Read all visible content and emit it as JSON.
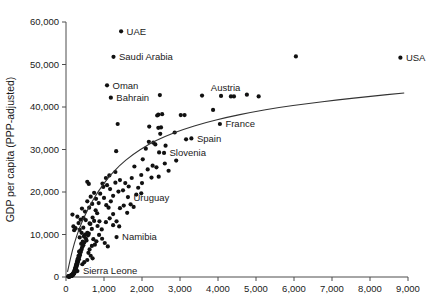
{
  "chart_data": {
    "type": "scatter",
    "title": "",
    "xlabel": "",
    "ylabel": "GDP per capita (PPP-adjusted)",
    "xlim": [
      0,
      9000
    ],
    "ylim": [
      0,
      60000
    ],
    "grid": false,
    "legend": null,
    "xticks": [
      "0",
      "1,000",
      "2,000",
      "3,000",
      "4,000",
      "5,000",
      "6,000",
      "7,000",
      "8,000",
      "9,000"
    ],
    "xtick_values": [
      0,
      1000,
      2000,
      3000,
      4000,
      5000,
      6000,
      7000,
      8000,
      9000
    ],
    "yticks": [
      "0",
      "10,000",
      "20,000",
      "30,000",
      "40,000",
      "50,000",
      "60,000"
    ],
    "ytick_values": [
      0,
      10000,
      20000,
      30000,
      40000,
      50000,
      60000
    ],
    "marker_color": "#111111",
    "trend_color": "#333333",
    "annotations": [
      {
        "label": "UAE",
        "x": 1450,
        "y": 57800,
        "anchor": "right"
      },
      {
        "label": "Saudi Arabia",
        "x": 1250,
        "y": 51800,
        "anchor": "right"
      },
      {
        "label": "Oman",
        "x": 1080,
        "y": 45100,
        "anchor": "right"
      },
      {
        "label": "Bahrain",
        "x": 1180,
        "y": 42200,
        "anchor": "right"
      },
      {
        "label": "Austria",
        "x": 4200,
        "y": 42300,
        "anchor": "above"
      },
      {
        "label": "France",
        "x": 4050,
        "y": 36000,
        "anchor": "right"
      },
      {
        "label": "Spain",
        "x": 3300,
        "y": 32600,
        "anchor": "right"
      },
      {
        "label": "Slovenia",
        "x": 2580,
        "y": 29200,
        "anchor": "right"
      },
      {
        "label": "Uruguay",
        "x": 1630,
        "y": 18800,
        "anchor": "right"
      },
      {
        "label": "Namibia",
        "x": 1330,
        "y": 9400,
        "anchor": "right"
      },
      {
        "label": "Sierra Leone",
        "x": 300,
        "y": 1400,
        "anchor": "right"
      },
      {
        "label": "USA",
        "x": 8800,
        "y": 51600,
        "anchor": "right"
      }
    ],
    "points": [
      [
        8800,
        51600
      ],
      [
        6050,
        51900
      ],
      [
        1450,
        57800
      ],
      [
        1250,
        51800
      ],
      [
        1080,
        45100
      ],
      [
        1180,
        42200
      ],
      [
        2470,
        42800
      ],
      [
        3580,
        42700
      ],
      [
        4080,
        42600
      ],
      [
        4340,
        42500
      ],
      [
        4420,
        42500
      ],
      [
        4760,
        42900
      ],
      [
        5070,
        42500
      ],
      [
        2430,
        38200
      ],
      [
        2530,
        38300
      ],
      [
        2400,
        38000
      ],
      [
        2190,
        35400
      ],
      [
        2430,
        35100
      ],
      [
        2500,
        35200
      ],
      [
        3870,
        39300
      ],
      [
        4050,
        36000
      ],
      [
        1360,
        36000
      ],
      [
        1320,
        29600
      ],
      [
        3020,
        38100
      ],
      [
        3120,
        38100
      ],
      [
        2860,
        34000
      ],
      [
        2480,
        33700
      ],
      [
        3300,
        32600
      ],
      [
        3160,
        32400
      ],
      [
        2580,
        29200
      ],
      [
        2450,
        29300
      ],
      [
        2620,
        30900
      ],
      [
        2300,
        31600
      ],
      [
        2350,
        31200
      ],
      [
        2180,
        31800
      ],
      [
        2100,
        30200
      ],
      [
        2020,
        27700
      ],
      [
        2280,
        26200
      ],
      [
        2380,
        25800
      ],
      [
        2440,
        23600
      ],
      [
        2150,
        25300
      ],
      [
        1980,
        24000
      ],
      [
        1800,
        26000
      ],
      [
        1730,
        23300
      ],
      [
        1650,
        21300
      ],
      [
        1560,
        22100
      ],
      [
        1500,
        20400
      ],
      [
        1420,
        22800
      ],
      [
        1380,
        20100
      ],
      [
        1300,
        22200
      ],
      [
        1240,
        19100
      ],
      [
        1180,
        17800
      ],
      [
        1120,
        16300
      ],
      [
        1060,
        16900
      ],
      [
        1000,
        18600
      ],
      [
        960,
        22000
      ],
      [
        900,
        19600
      ],
      [
        860,
        17400
      ],
      [
        820,
        15000
      ],
      [
        780,
        15700
      ],
      [
        740,
        13200
      ],
      [
        700,
        14000
      ],
      [
        680,
        11300
      ],
      [
        640,
        12500
      ],
      [
        600,
        10200
      ],
      [
        580,
        9800
      ],
      [
        560,
        10400
      ],
      [
        540,
        8600
      ],
      [
        520,
        9100
      ],
      [
        500,
        10000
      ],
      [
        480,
        8100
      ],
      [
        470,
        9600
      ],
      [
        455,
        7500
      ],
      [
        440,
        8300
      ],
      [
        425,
        7000
      ],
      [
        410,
        6500
      ],
      [
        400,
        7800
      ],
      [
        390,
        5900
      ],
      [
        380,
        6200
      ],
      [
        370,
        5200
      ],
      [
        360,
        5700
      ],
      [
        350,
        4700
      ],
      [
        345,
        6000
      ],
      [
        340,
        4200
      ],
      [
        330,
        5000
      ],
      [
        320,
        3800
      ],
      [
        315,
        4400
      ],
      [
        310,
        3400
      ],
      [
        300,
        4000
      ],
      [
        295,
        3000
      ],
      [
        290,
        3600
      ],
      [
        285,
        2700
      ],
      [
        280,
        3200
      ],
      [
        275,
        2400
      ],
      [
        270,
        2900
      ],
      [
        265,
        2100
      ],
      [
        260,
        2600
      ],
      [
        255,
        1800
      ],
      [
        250,
        2300
      ],
      [
        245,
        1500
      ],
      [
        240,
        2000
      ],
      [
        235,
        1300
      ],
      [
        230,
        1700
      ],
      [
        225,
        1100
      ],
      [
        220,
        1400
      ],
      [
        215,
        900
      ],
      [
        210,
        1200
      ],
      [
        205,
        750
      ],
      [
        200,
        1000
      ],
      [
        195,
        620
      ],
      [
        190,
        850
      ],
      [
        185,
        520
      ],
      [
        180,
        700
      ],
      [
        175,
        440
      ],
      [
        170,
        600
      ],
      [
        165,
        380
      ],
      [
        160,
        520
      ],
      [
        155,
        320
      ],
      [
        150,
        450
      ],
      [
        145,
        280
      ],
      [
        140,
        400
      ],
      [
        135,
        240
      ],
      [
        130,
        350
      ],
      [
        125,
        210
      ],
      [
        120,
        310
      ],
      [
        115,
        180
      ],
      [
        110,
        270
      ],
      [
        105,
        160
      ],
      [
        100,
        230
      ],
      [
        95,
        140
      ],
      [
        90,
        200
      ],
      [
        85,
        120
      ],
      [
        80,
        180
      ],
      [
        75,
        105
      ],
      [
        70,
        160
      ],
      [
        65,
        95
      ],
      [
        60,
        140
      ],
      [
        170,
        14700
      ],
      [
        195,
        11900
      ],
      [
        215,
        11000
      ],
      [
        250,
        11500
      ],
      [
        300,
        14200
      ],
      [
        330,
        12700
      ],
      [
        360,
        11100
      ],
      [
        385,
        13500
      ],
      [
        420,
        16100
      ],
      [
        460,
        13900
      ],
      [
        500,
        15400
      ],
      [
        560,
        17800
      ],
      [
        610,
        16300
      ],
      [
        650,
        18900
      ],
      [
        690,
        17200
      ],
      [
        740,
        19800
      ],
      [
        790,
        18400
      ],
      [
        560,
        22400
      ],
      [
        600,
        21900
      ],
      [
        980,
        21200
      ],
      [
        1080,
        21600
      ],
      [
        1160,
        20700
      ],
      [
        1240,
        14800
      ],
      [
        1330,
        9400
      ],
      [
        1630,
        18800
      ],
      [
        1420,
        16200
      ],
      [
        1520,
        16800
      ],
      [
        1610,
        15100
      ],
      [
        1700,
        17100
      ],
      [
        1780,
        16500
      ],
      [
        1240,
        12200
      ],
      [
        1150,
        13800
      ],
      [
        1050,
        12900
      ],
      [
        940,
        11200
      ],
      [
        870,
        9900
      ],
      [
        800,
        8400
      ],
      [
        760,
        7600
      ],
      [
        720,
        8900
      ],
      [
        680,
        7300
      ],
      [
        1400,
        11900
      ],
      [
        1330,
        13100
      ],
      [
        1850,
        19400
      ],
      [
        1900,
        21000
      ],
      [
        2000,
        22100
      ],
      [
        2250,
        23400
      ],
      [
        1980,
        19700
      ],
      [
        1050,
        23300
      ],
      [
        1140,
        23900
      ],
      [
        1300,
        24700
      ],
      [
        880,
        13100
      ],
      [
        830,
        12000
      ],
      [
        300,
        1400
      ],
      [
        520,
        13400
      ],
      [
        620,
        12600
      ],
      [
        455,
        11600
      ],
      [
        410,
        10400
      ],
      [
        360,
        9300
      ],
      [
        950,
        9000
      ],
      [
        1020,
        8000
      ],
      [
        1100,
        7200
      ],
      [
        620,
        6500
      ],
      [
        590,
        5700
      ],
      [
        650,
        5000
      ],
      [
        700,
        4400
      ],
      [
        560,
        4000
      ],
      [
        480,
        3500
      ],
      [
        430,
        3000
      ],
      [
        2600,
        26700
      ],
      [
        2700,
        25000
      ],
      [
        2900,
        27400
      ]
    ],
    "trend_curve": [
      [
        40,
        1200
      ],
      [
        120,
        4500
      ],
      [
        220,
        8000
      ],
      [
        340,
        11200
      ],
      [
        480,
        14200
      ],
      [
        650,
        17200
      ],
      [
        850,
        20200
      ],
      [
        1100,
        23300
      ],
      [
        1400,
        26200
      ],
      [
        1750,
        28800
      ],
      [
        2150,
        31100
      ],
      [
        2600,
        33100
      ],
      [
        3100,
        34800
      ],
      [
        3650,
        36300
      ],
      [
        4250,
        37600
      ],
      [
        4900,
        38800
      ],
      [
        5600,
        39900
      ],
      [
        6350,
        40800
      ],
      [
        7150,
        41700
      ],
      [
        8000,
        42500
      ],
      [
        8900,
        43300
      ]
    ]
  }
}
